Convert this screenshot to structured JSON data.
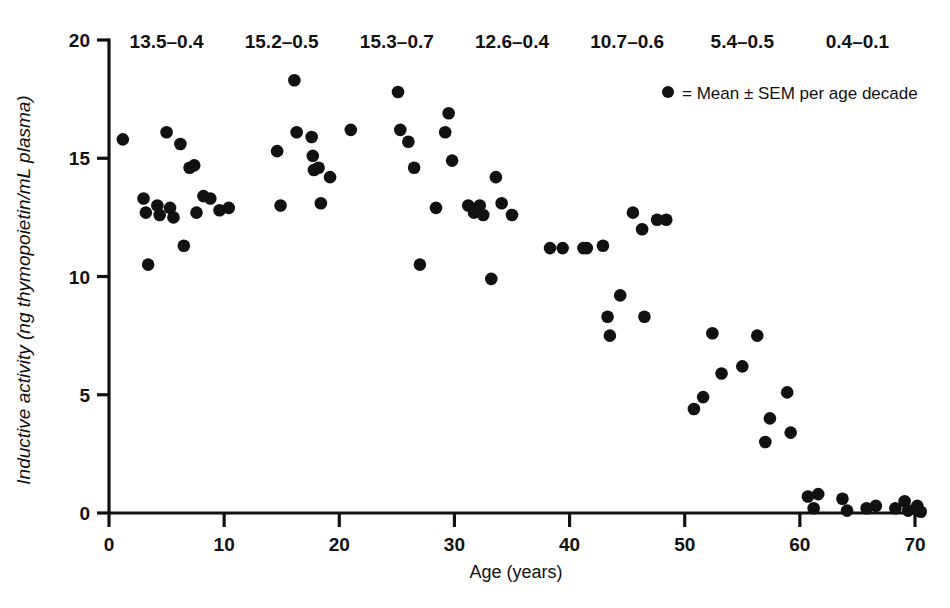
{
  "chart_data": {
    "type": "scatter",
    "title": "",
    "xlabel": "Age (years)",
    "ylabel": "Inductive activity (ng thymopoietin/mL plasma)",
    "xlim": [
      0,
      71
    ],
    "ylim": [
      0,
      20
    ],
    "xticks": [
      "0",
      "10",
      "20",
      "30",
      "40",
      "50",
      "60",
      "70"
    ],
    "xtick_values": [
      0,
      10,
      20,
      30,
      40,
      50,
      60,
      70
    ],
    "yticks": [
      "0",
      "5",
      "10",
      "15",
      "20"
    ],
    "ytick_values": [
      0,
      5,
      10,
      15,
      20
    ],
    "grid": false,
    "legend_position": "top-right",
    "legend": [
      {
        "marker": "filled-circle",
        "label": "= Mean ± SEM per age decade"
      }
    ],
    "decade_summary_labels": [
      {
        "label": "13.5–0.4",
        "decade": "0–9",
        "mean": 13.5,
        "sem": 0.4,
        "x_center": 5
      },
      {
        "label": "15.2–0.5",
        "decade": "10–19",
        "mean": 15.2,
        "sem": 0.5,
        "x_center": 15
      },
      {
        "label": "15.3–0.7",
        "decade": "20–29",
        "mean": 15.3,
        "sem": 0.7,
        "x_center": 25
      },
      {
        "label": "12.6–0.4",
        "decade": "30–39",
        "mean": 12.6,
        "sem": 0.4,
        "x_center": 35
      },
      {
        "label": "10.7–0.6",
        "decade": "40–49",
        "mean": 10.7,
        "sem": 0.6,
        "x_center": 45
      },
      {
        "label": "5.4–0.5",
        "decade": "50–59",
        "mean": 5.4,
        "sem": 0.5,
        "x_center": 55
      },
      {
        "label": "0.4–0.1",
        "decade": "60–71",
        "mean": 0.4,
        "sem": 0.1,
        "x_center": 65
      }
    ],
    "series": [
      {
        "name": "Inductive activity per subject",
        "marker": "filled-circle",
        "color": "#111111",
        "points": [
          [
            1.2,
            15.8
          ],
          [
            3.0,
            13.3
          ],
          [
            3.2,
            12.7
          ],
          [
            3.4,
            10.5
          ],
          [
            4.2,
            13.0
          ],
          [
            4.4,
            12.6
          ],
          [
            5.0,
            16.1
          ],
          [
            5.3,
            12.9
          ],
          [
            5.6,
            12.5
          ],
          [
            6.2,
            15.6
          ],
          [
            6.5,
            11.3
          ],
          [
            7.0,
            14.6
          ],
          [
            7.4,
            14.7
          ],
          [
            7.6,
            12.7
          ],
          [
            8.2,
            13.4
          ],
          [
            8.8,
            13.3
          ],
          [
            9.6,
            12.8
          ],
          [
            10.4,
            12.9
          ],
          [
            14.6,
            15.3
          ],
          [
            14.9,
            13.0
          ],
          [
            16.1,
            18.3
          ],
          [
            16.3,
            16.1
          ],
          [
            17.6,
            15.9
          ],
          [
            17.7,
            15.1
          ],
          [
            17.8,
            14.5
          ],
          [
            18.2,
            14.6
          ],
          [
            18.4,
            13.1
          ],
          [
            19.2,
            14.2
          ],
          [
            21.0,
            16.2
          ],
          [
            25.1,
            17.8
          ],
          [
            25.3,
            16.2
          ],
          [
            26.0,
            15.7
          ],
          [
            26.5,
            14.6
          ],
          [
            27.0,
            10.5
          ],
          [
            28.4,
            12.9
          ],
          [
            29.2,
            16.1
          ],
          [
            29.5,
            16.9
          ],
          [
            29.8,
            14.9
          ],
          [
            31.2,
            13.0
          ],
          [
            31.7,
            12.7
          ],
          [
            32.2,
            13.0
          ],
          [
            32.5,
            12.6
          ],
          [
            33.2,
            9.9
          ],
          [
            33.6,
            14.2
          ],
          [
            34.1,
            13.1
          ],
          [
            35.0,
            12.6
          ],
          [
            38.3,
            11.2
          ],
          [
            39.4,
            11.2
          ],
          [
            41.2,
            11.2
          ],
          [
            41.5,
            11.2
          ],
          [
            42.9,
            11.3
          ],
          [
            43.3,
            8.3
          ],
          [
            43.5,
            7.5
          ],
          [
            44.4,
            9.2
          ],
          [
            45.5,
            12.7
          ],
          [
            46.3,
            12.0
          ],
          [
            46.5,
            8.3
          ],
          [
            47.6,
            12.4
          ],
          [
            48.4,
            12.4
          ],
          [
            50.8,
            4.4
          ],
          [
            51.6,
            4.9
          ],
          [
            52.4,
            7.6
          ],
          [
            53.2,
            5.9
          ],
          [
            55.0,
            6.2
          ],
          [
            56.3,
            7.5
          ],
          [
            57.0,
            3.0
          ],
          [
            57.4,
            4.0
          ],
          [
            58.9,
            5.1
          ],
          [
            59.2,
            3.4
          ],
          [
            60.7,
            0.7
          ],
          [
            61.2,
            0.2
          ],
          [
            61.6,
            0.8
          ],
          [
            63.7,
            0.6
          ],
          [
            64.1,
            0.1
          ],
          [
            65.8,
            0.2
          ],
          [
            66.6,
            0.3
          ],
          [
            68.3,
            0.2
          ],
          [
            69.1,
            0.5
          ],
          [
            69.4,
            0.1
          ],
          [
            70.2,
            0.3
          ],
          [
            70.5,
            0.05
          ]
        ]
      }
    ]
  }
}
